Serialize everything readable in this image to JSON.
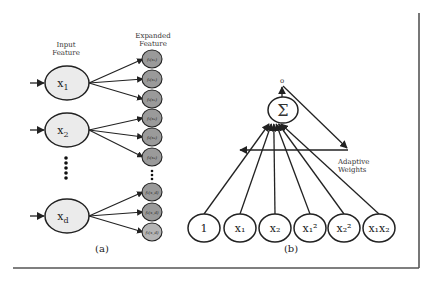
{
  "panel_a": {
    "header_input": [
      "Input",
      "Feature"
    ],
    "header_expanded": [
      "Expanded",
      "Feature"
    ],
    "inputs": [
      {
        "base": "x",
        "sub": "1"
      },
      {
        "base": "x",
        "sub": "2"
      },
      {
        "base": "x",
        "sub": "d"
      }
    ],
    "expanded_groups": [
      [
        "f₁(x₁)",
        "f₂(x₁)",
        "f₃(x₁)"
      ],
      [
        "f₁(x₂)",
        "f₂(x₂)",
        "f₃(x₂)"
      ],
      [
        "f₁(x_d)",
        "f₂(x_d)",
        "f₃(x_d)"
      ]
    ],
    "caption": "(a)"
  },
  "panel_b": {
    "output_label": "o",
    "sum_symbol": "Σ",
    "weights_label": [
      "Adaptive",
      "Weights"
    ],
    "inputs": [
      {
        "id": "bias",
        "text": "1"
      },
      {
        "id": "x1",
        "text": "x₁"
      },
      {
        "id": "x2",
        "text": "x₂"
      },
      {
        "id": "x1sq",
        "text": "x₁²"
      },
      {
        "id": "x2sq",
        "text": "x₂²"
      },
      {
        "id": "x1x2",
        "text": "x₁x₂"
      }
    ],
    "caption": "(b)"
  },
  "colors": {
    "input_fill": "#ebebeb",
    "expanded_fill": "#9a9a9a",
    "expanded_fill_last": "#b5b5b5",
    "stroke": "#222222",
    "frame": "#555555"
  }
}
